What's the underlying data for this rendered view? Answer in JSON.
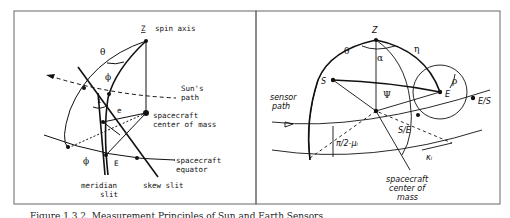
{
  "figure": {
    "caption": "Figure 1.3.2.  Measurement Principles of Sun and Earth Sensors",
    "left_panel": {
      "labels": {
        "spin_axis_symbol": "Z",
        "spin_axis": "spin axis",
        "theta": "θ",
        "phi_top": "ϕ",
        "suns_path_1": "Sun's",
        "suns_path_2": "path",
        "i": "i",
        "e": "e",
        "center_1": "spacecraft",
        "center_2": "center of mass",
        "phi_bottom": "ϕ",
        "E": "E",
        "equator_1": "spacecraft",
        "equator_2": "equator",
        "meridian_1": "meridian",
        "meridian_2": "slit",
        "skew": "skew slit"
      }
    },
    "right_panel": {
      "labels": {
        "Z": "Z",
        "theta": "θ",
        "eta": "η",
        "alpha": "α",
        "S": "S",
        "psi": "Ψ",
        "rho": "ρ",
        "E": "E",
        "ES": "E/S",
        "sensor_1": "sensor",
        "sensor_2": "path",
        "SE": "S/E",
        "mu": "π/2-μᵢ",
        "kappa": "κᵢ",
        "center_1": "spacecraft",
        "center_2": "center of",
        "center_3": "mass"
      }
    }
  }
}
